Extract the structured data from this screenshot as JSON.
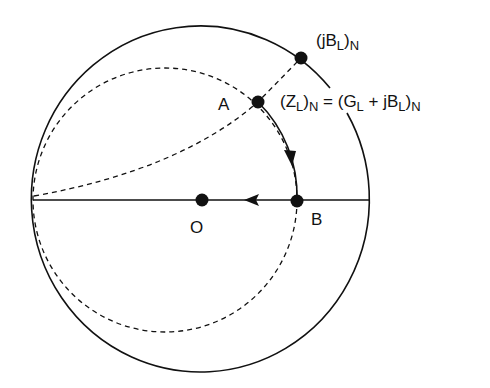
{
  "diagram": {
    "type": "smith-chart-admittance-matching",
    "colors": {
      "line": "#111111",
      "background": "#ffffff"
    },
    "points": {
      "A": {
        "label": "A",
        "x": 258,
        "y": 102
      },
      "O": {
        "label": "O",
        "x": 202,
        "y": 200
      },
      "B": {
        "label": "B",
        "x": 297,
        "y": 201
      },
      "jB": {
        "x": 301,
        "y": 58
      }
    },
    "labels": {
      "point_a": "A",
      "point_o": "O",
      "point_b": "B",
      "jb_label": {
        "open": "(jB",
        "sub1": "L",
        "close": ")",
        "sub2": "N"
      },
      "zl_label": {
        "part1": "(Z",
        "sub1": "L",
        "part2": ")",
        "sub2": "N",
        "part3": " = (G",
        "sub3": "L",
        "part4": " + jB",
        "sub4": "L",
        "part5": ")",
        "sub5": "N"
      }
    },
    "curves": [
      {
        "name": "outer-boundary-circle",
        "style": "solid"
      },
      {
        "name": "real-axis",
        "style": "solid"
      },
      {
        "name": "constant-conductance-circle",
        "style": "dashed"
      },
      {
        "name": "constant-susceptance-arc",
        "style": "dashed"
      },
      {
        "name": "path-a-to-b",
        "style": "solid",
        "arrow": "toward B"
      },
      {
        "name": "path-b-to-o",
        "style": "solid",
        "arrow": "toward O"
      }
    ]
  }
}
